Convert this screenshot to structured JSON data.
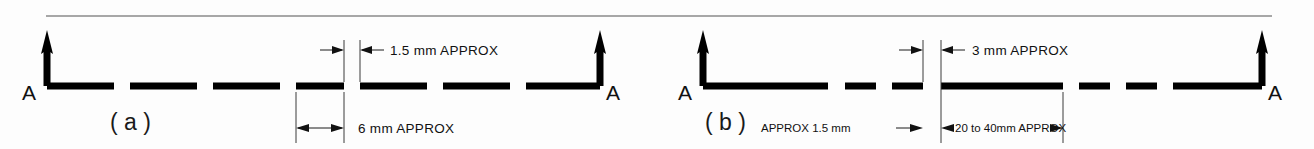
{
  "figure": {
    "title_rule": "horizontal-rule",
    "background_color": "#fdfdfd",
    "line_color": "#000000",
    "rule_color": "#8a8a8a"
  },
  "diagram_a": {
    "label": "( a )",
    "section_letter_left": "A",
    "section_letter_right": "A",
    "gap_dimension": "1.5 mm   APPROX",
    "dash_dimension": "6 mm  APPROX",
    "line_style": "dashed-cutting-plane",
    "dash_count": 9
  },
  "diagram_b": {
    "label": "( b )",
    "section_letter_left": "A",
    "section_letter_right": "A",
    "gap_dimension": "3 mm   APPROX",
    "short_dash_dimension": "APPROX  1.5 mm",
    "long_dash_dimension": "20 to 40mm APPROX",
    "line_style": "chain-cutting-plane",
    "dash_count": 9
  }
}
